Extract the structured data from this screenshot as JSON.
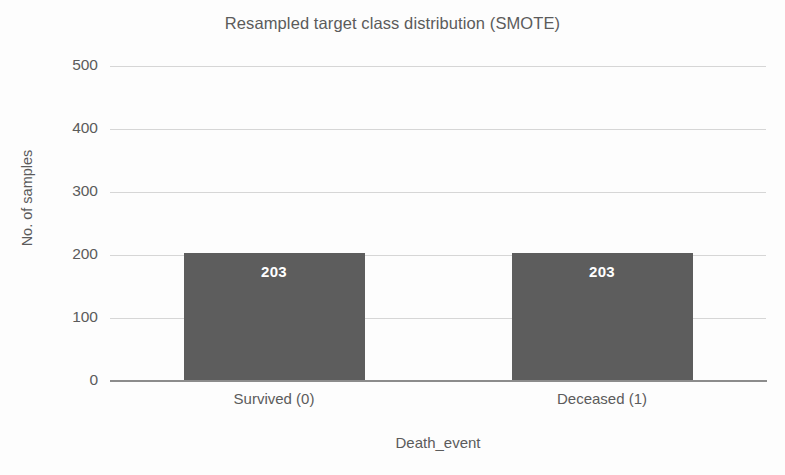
{
  "chart_data": {
    "type": "bar",
    "title": "Resampled target class distribution (SMOTE)",
    "xlabel": "Death_event",
    "ylabel": "No. of samples",
    "categories": [
      "Survived (0)",
      "Deceased (1)"
    ],
    "values": [
      203,
      203
    ],
    "data_labels": [
      "203",
      "203"
    ],
    "ylim": [
      0,
      500
    ],
    "yticks": [
      0,
      100,
      200,
      300,
      400,
      500
    ],
    "ytick_labels": [
      "0",
      "100",
      "200",
      "300",
      "400",
      "500"
    ],
    "grid": "horizontal",
    "legend": "none",
    "bar_color": "#5d5d5d",
    "data_label_color": "#ffffff",
    "gridline_color": "#d6d6d6",
    "axis_color": "#8c8c8c",
    "text_color": "#5b5b5b",
    "background_color": "#fdfdfd"
  }
}
